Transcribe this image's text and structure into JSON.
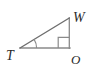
{
  "figure": {
    "type": "geometry-diagram",
    "shape": "right-triangle",
    "name": "triangle-TWO",
    "canvas": {
      "width": 91,
      "height": 81,
      "background": "#ffffff"
    },
    "stroke": {
      "color": "#8a8a8a",
      "dark_color": "#6e6e6e",
      "width": 1.2
    },
    "label_color": "#2b2b2b",
    "vertices": [
      {
        "id": "T",
        "label": "T",
        "x": 20,
        "y": 48,
        "label_x": 7,
        "label_y": 59,
        "role": "acute-angle-vertex"
      },
      {
        "id": "W",
        "label": "W",
        "x": 69,
        "y": 18,
        "label_x": 73,
        "label_y": 22,
        "role": "apex"
      },
      {
        "id": "O",
        "label": "O",
        "x": 69,
        "y": 48,
        "label_x": 72,
        "label_y": 63,
        "role": "right-angle-vertex"
      }
    ],
    "edges": [
      {
        "id": "TO",
        "from": "T",
        "to": "O",
        "name": "base-leg"
      },
      {
        "id": "OW",
        "from": "O",
        "to": "W",
        "name": "vertical-leg"
      },
      {
        "id": "TW",
        "from": "T",
        "to": "W",
        "name": "hypotenuse"
      }
    ],
    "markers": [
      {
        "id": "right-angle-O",
        "type": "right-angle-square",
        "at": "O",
        "size": 11
      },
      {
        "id": "angle-arc-T",
        "type": "angle-arc",
        "at": "T",
        "radius": 16
      }
    ]
  }
}
